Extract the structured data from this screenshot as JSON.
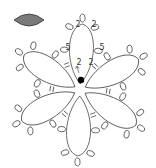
{
  "diagram": {
    "type": "tatting-flower",
    "shuttle_icon": {
      "name": "shuttle-icon",
      "fill": "#7a7a7a",
      "stroke": "#333333"
    },
    "center": [
      80,
      90
    ],
    "petal_count": 6,
    "stitch_labels": [
      {
        "text": "2",
        "x": 78,
        "y": 27
      },
      {
        "text": "2",
        "x": 94,
        "y": 27
      },
      {
        "text": "5",
        "x": 68,
        "y": 50
      },
      {
        "text": "5",
        "x": 102,
        "y": 50
      },
      {
        "text": "2",
        "x": 79,
        "y": 65
      },
      {
        "text": "2",
        "x": 91,
        "y": 65
      }
    ],
    "start_dot": {
      "x": 81,
      "y": 80
    },
    "colors": {
      "line": "#333333",
      "dot": "#000000",
      "background": "#ffffff"
    }
  }
}
